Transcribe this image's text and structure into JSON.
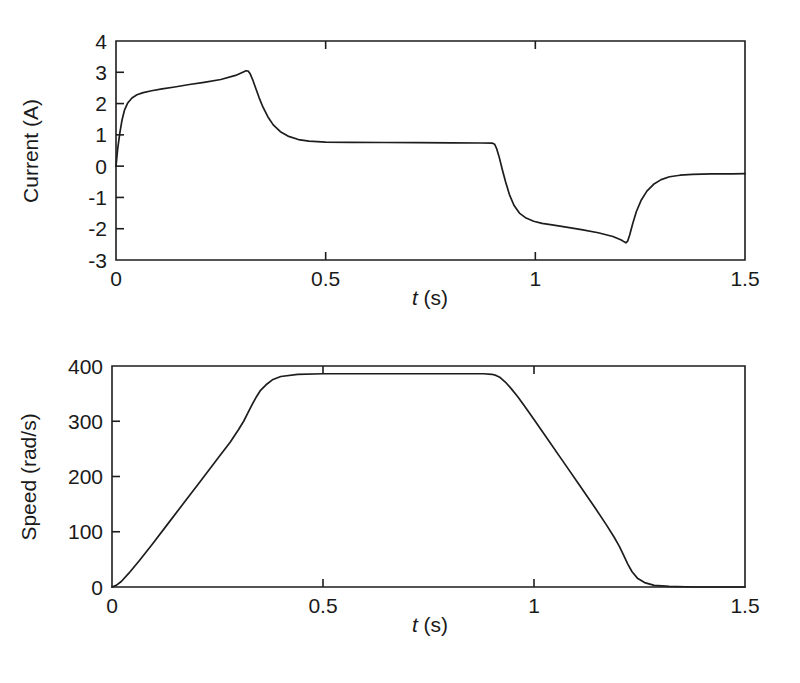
{
  "figure": {
    "background": "#ffffff",
    "ink_color": "#1d1d1d",
    "panels": [
      "current",
      "speed"
    ]
  },
  "chart_data": [
    {
      "id": "current",
      "type": "line",
      "title": "",
      "xlabel": "t (s)",
      "xlabel_symbol": "t",
      "xlabel_unit": " (s)",
      "ylabel": "Current (A)",
      "xlim": [
        0,
        1.5
      ],
      "ylim": [
        -3,
        4
      ],
      "xticks": [
        0,
        0.5,
        1,
        1.5
      ],
      "xticklabels": [
        "0",
        "0.5",
        "1",
        "1.5"
      ],
      "yticks": [
        -3,
        -2,
        -1,
        0,
        1,
        2,
        3,
        4
      ],
      "yticklabels": [
        "-3",
        "-2",
        "-1",
        "0",
        "1",
        "2",
        "3",
        "4"
      ],
      "grid": false,
      "legend": "none",
      "series": [
        {
          "name": "armature current",
          "x": [
            0.0,
            0.004,
            0.009,
            0.014,
            0.02,
            0.028,
            0.038,
            0.05,
            0.065,
            0.085,
            0.11,
            0.14,
            0.175,
            0.21,
            0.25,
            0.285,
            0.305,
            0.31,
            0.315,
            0.32,
            0.326,
            0.333,
            0.341,
            0.35,
            0.362,
            0.375,
            0.392,
            0.41,
            0.435,
            0.46,
            0.5,
            0.56,
            0.64,
            0.72,
            0.8,
            0.87,
            0.898,
            0.903,
            0.908,
            0.914,
            0.921,
            0.929,
            0.938,
            0.949,
            0.962,
            0.978,
            0.996,
            1.016,
            1.04,
            1.07,
            1.11,
            1.15,
            1.185,
            1.205,
            1.212,
            1.216,
            1.22,
            1.225,
            1.232,
            1.241,
            1.252,
            1.266,
            1.282,
            1.3,
            1.32,
            1.345,
            1.375,
            1.42,
            1.47,
            1.5
          ],
          "y": [
            0.0,
            0.55,
            1.05,
            1.45,
            1.78,
            2.02,
            2.18,
            2.28,
            2.35,
            2.41,
            2.47,
            2.53,
            2.61,
            2.68,
            2.77,
            2.9,
            3.02,
            3.05,
            3.04,
            2.95,
            2.76,
            2.5,
            2.2,
            1.9,
            1.58,
            1.32,
            1.1,
            0.96,
            0.85,
            0.8,
            0.77,
            0.76,
            0.755,
            0.75,
            0.745,
            0.74,
            0.735,
            0.7,
            0.55,
            0.28,
            -0.1,
            -0.5,
            -0.9,
            -1.25,
            -1.5,
            -1.66,
            -1.76,
            -1.83,
            -1.88,
            -1.94,
            -2.03,
            -2.13,
            -2.25,
            -2.36,
            -2.42,
            -2.45,
            -2.4,
            -2.2,
            -1.85,
            -1.45,
            -1.1,
            -0.8,
            -0.58,
            -0.43,
            -0.34,
            -0.29,
            -0.26,
            -0.25,
            -0.245,
            -0.24
          ]
        }
      ],
      "annotations": [
        {
          "label": "peak current",
          "t": 0.31,
          "value": 3.05
        },
        {
          "label": "first plateau",
          "t": 0.6,
          "value": 0.76
        },
        {
          "label": "braking trough",
          "t": 1.21,
          "value": -2.45
        },
        {
          "label": "final level",
          "t": 1.5,
          "value": -0.24
        }
      ]
    },
    {
      "id": "speed",
      "type": "line",
      "title": "",
      "xlabel": "t (s)",
      "xlabel_symbol": "t",
      "xlabel_unit": " (s)",
      "ylabel": "Speed (rad/s)",
      "xlim": [
        0,
        1.5
      ],
      "ylim": [
        0,
        400
      ],
      "xticks": [
        0,
        0.5,
        1,
        1.5
      ],
      "xticklabels": [
        "0",
        "0.5",
        "1",
        "1.5"
      ],
      "yticks": [
        0,
        100,
        200,
        300,
        400
      ],
      "yticklabels": [
        "0",
        "100",
        "200",
        "300",
        "400"
      ],
      "grid": false,
      "legend": "none",
      "series": [
        {
          "name": "shaft speed",
          "x": [
            0.0,
            0.01,
            0.022,
            0.04,
            0.065,
            0.095,
            0.13,
            0.17,
            0.21,
            0.25,
            0.28,
            0.3,
            0.312,
            0.322,
            0.332,
            0.342,
            0.352,
            0.365,
            0.38,
            0.4,
            0.44,
            0.5,
            0.58,
            0.66,
            0.74,
            0.82,
            0.88,
            0.9,
            0.91,
            0.92,
            0.932,
            0.946,
            0.962,
            0.98,
            1.0,
            1.03,
            1.07,
            1.11,
            1.145,
            1.172,
            1.19,
            1.202,
            1.212,
            1.222,
            1.232,
            1.245,
            1.262,
            1.285,
            1.32,
            1.38,
            1.44,
            1.5
          ],
          "y": [
            0,
            3,
            10,
            25,
            48,
            77,
            112,
            152,
            192,
            232,
            262,
            285,
            300,
            315,
            330,
            344,
            356,
            366,
            375,
            381,
            385,
            386,
            386,
            386,
            386,
            386,
            386,
            385,
            383,
            379,
            371,
            359,
            344,
            325,
            303,
            270,
            226,
            182,
            143,
            112,
            90,
            74,
            58,
            42,
            28,
            16,
            8,
            3,
            1,
            0,
            0,
            0
          ]
        }
      ],
      "annotations": [
        {
          "label": "cruise speed",
          "t": 0.6,
          "value": 386
        },
        {
          "label": "end of ramp-up",
          "t": 0.33,
          "value": 386
        },
        {
          "label": "start of deceleration",
          "t": 0.9,
          "value": 385
        },
        {
          "label": "stop",
          "t": 1.22,
          "value": 0
        }
      ]
    }
  ]
}
